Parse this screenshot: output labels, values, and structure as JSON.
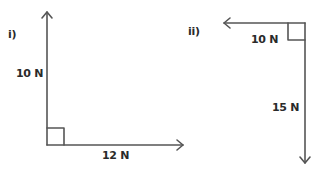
{
  "diagrams": [
    {
      "label": "i)",
      "forces": [
        {
          "name": "vertical",
          "label": "10 N",
          "direction": "up"
        },
        {
          "name": "horizontal",
          "label": "12 N",
          "direction": "right"
        }
      ],
      "right_angle": true
    },
    {
      "label": "ii)",
      "forces": [
        {
          "name": "horizontal",
          "label": "10 N",
          "direction": "left"
        },
        {
          "name": "vertical",
          "label": "15 N",
          "direction": "down"
        }
      ],
      "right_angle": true
    }
  ],
  "colors": {
    "line": "#555555",
    "text": "#2a2a2a"
  }
}
